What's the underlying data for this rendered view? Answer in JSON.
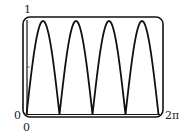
{
  "chart_data": {
    "type": "line",
    "title": "",
    "xlabel": "",
    "ylabel": "",
    "function": "|sin(2x)|",
    "xlim": [
      0,
      6.2832
    ],
    "ylim": [
      0,
      1
    ],
    "x_tick_labels": [
      "0",
      "2π"
    ],
    "y_tick_labels": [
      "0",
      "1"
    ],
    "grid": false,
    "legend": null,
    "series": [
      {
        "name": "|sin(2x)|",
        "x": [
          0,
          0.3927,
          0.7854,
          1.1781,
          1.5708,
          1.9635,
          2.3562,
          2.7489,
          3.1416,
          3.5343,
          3.927,
          4.3197,
          4.7124,
          5.1051,
          5.4978,
          5.8905,
          6.2832
        ],
        "values": [
          0,
          0.707,
          1,
          0.707,
          0,
          0.707,
          1,
          0.707,
          0,
          0.707,
          1,
          0.707,
          0,
          0.707,
          1,
          0.707,
          0
        ]
      }
    ],
    "color": "#111111"
  },
  "labels": {
    "y_max": "1",
    "y_min": "0",
    "x_min": "0",
    "x_max": "2π"
  }
}
